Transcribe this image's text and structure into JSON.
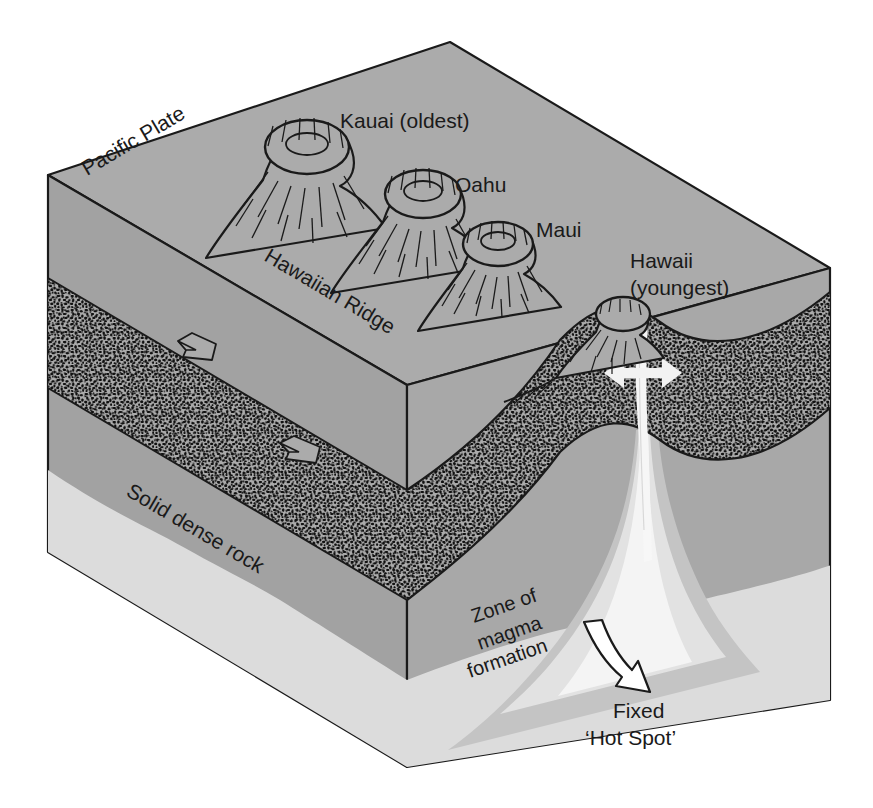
{
  "figure": {
    "kind": "geological-block-diagram",
    "background_color": "#ffffff"
  },
  "palette": {
    "mantle_gray": "#a8a8a8",
    "front_face_gray": "#a2a2a2",
    "top_face_gray": "#ababab",
    "lithosphere_speckle": "#111111",
    "deep_light_band": "#dcdcdc",
    "plume_core": "#f4f4f4",
    "plume_mid": "#e2e2e2",
    "plume_outer": "#c4c4c4",
    "outline": "#1a1a1a",
    "text": "#1a1a1a"
  },
  "labels": {
    "pacific_plate": "Pacific Plate",
    "kauai": "Kauai (oldest)",
    "oahu": "Oahu",
    "maui": "Maui",
    "hawaiian_ridge": "Hawaiian Ridge",
    "hawaii_line1": "Hawaii",
    "hawaii_line2": "(youngest)",
    "solid_dense_rock": "Solid dense rock",
    "zone_line1": "Zone of",
    "zone_line2": "magma",
    "zone_line3": "formation",
    "hotspot_line1": "Fixed",
    "hotspot_line2": "‘Hot Spot’"
  },
  "volcanoes": [
    {
      "name": "Kauai (oldest)",
      "order": 1,
      "age_rank": "oldest"
    },
    {
      "name": "Oahu",
      "order": 2,
      "age_rank": "older"
    },
    {
      "name": "Maui",
      "order": 3,
      "age_rank": "younger"
    },
    {
      "name": "Hawaii (youngest)",
      "order": 4,
      "age_rank": "youngest",
      "active": true
    }
  ],
  "annotations": {
    "plate_motion_arrows": 3,
    "magma_arrow": "curved arrow pointing down-right to the hot spot",
    "conduit": "vertical magma conduit beneath Hawaii"
  }
}
